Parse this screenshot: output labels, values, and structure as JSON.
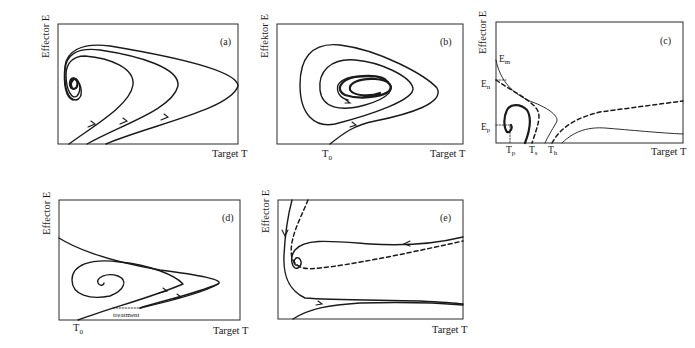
{
  "figure": {
    "panels": [
      {
        "id": "a",
        "label": "(a)",
        "xlabel": "Target T",
        "ylabel": "Effector E",
        "description": "Three trajectories starting near T axis, arrows pointing up-right, looping back and spiraling into a stable focus near the E axis"
      },
      {
        "id": "b",
        "label": "(b)",
        "xlabel": "Target T",
        "ylabel": "Effektor E",
        "tick_label": "T",
        "tick_sub": "0",
        "description": "Trajectory from T0 spirals inward toward a stable limit cycle / focus in center"
      },
      {
        "id": "c",
        "label": "(c)",
        "xlabel": "Target T",
        "ylabel": "Effector E",
        "y_marks": [
          {
            "main": "E",
            "sub": "m"
          },
          {
            "main": "E",
            "sub": "n"
          },
          {
            "main": "E",
            "sub": "p"
          }
        ],
        "x_marks": [
          {
            "main": "T",
            "sub": "p"
          },
          {
            "main": "T",
            "sub": "s"
          },
          {
            "main": "T",
            "sub": "h"
          }
        ],
        "description": "Nullclines (solid thin, dashed) and a thick closed loop near the origin"
      },
      {
        "id": "d",
        "label": "(d)",
        "xlabel": "Target T",
        "ylabel": "Effector E",
        "tick_label": "T",
        "tick_sub": "0",
        "annotation": "treatment",
        "description": "Trajectory from T0 with treatment jump, spiraling into focus"
      },
      {
        "id": "e",
        "label": "(e)",
        "xlabel": "Target T",
        "ylabel": "Effector E",
        "description": "Separatrix (dashed) with trajectories: one spiraling into focus near E axis, one escaping to large T"
      }
    ]
  }
}
